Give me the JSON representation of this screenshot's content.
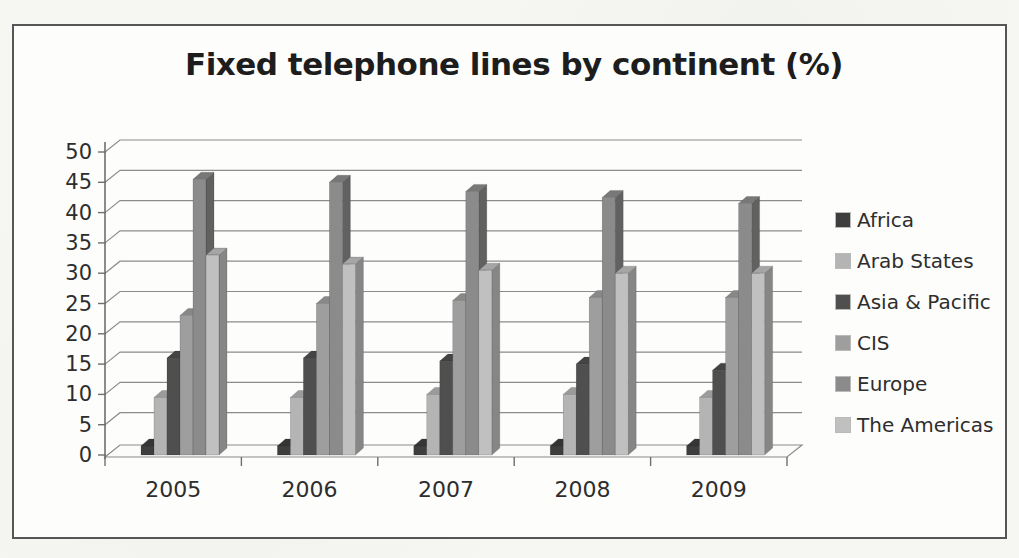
{
  "page": {
    "background": "#f6f6f2",
    "frame_border_color": "#565656"
  },
  "chart_data": {
    "type": "bar",
    "variant": "3d-clustered-column",
    "title": "Fixed telephone lines by continent (%)",
    "categories": [
      "2005",
      "2006",
      "2007",
      "2008",
      "2009"
    ],
    "series": [
      {
        "name": "Africa",
        "color": "#3e3e3e",
        "values": [
          1.5,
          1.5,
          1.5,
          1.5,
          1.5
        ]
      },
      {
        "name": "Arab States",
        "color": "#b4b4b4",
        "values": [
          9.5,
          9.5,
          10,
          10,
          9.5
        ]
      },
      {
        "name": "Asia & Pacific",
        "color": "#4f4f4f",
        "values": [
          16,
          16,
          15.5,
          15,
          14
        ]
      },
      {
        "name": "CIS",
        "color": "#9e9e9e",
        "values": [
          23,
          25,
          25.5,
          26,
          26
        ]
      },
      {
        "name": "Europe",
        "color": "#8b8b8b",
        "values": [
          45.5,
          45,
          43.5,
          42.5,
          41.5
        ]
      },
      {
        "name": "The Americas",
        "color": "#c0c0c0",
        "values": [
          33,
          31.5,
          30.5,
          30,
          30
        ]
      }
    ],
    "ylim": [
      0,
      50
    ],
    "ytick_step": 5,
    "xlabel": "",
    "ylabel": "",
    "grid": "horizontal",
    "legend_position": "right",
    "axis_text_color": "#2d2d2d",
    "gridline_color": "#8c8c8c",
    "axis_line_color": "#6f6f6f"
  }
}
